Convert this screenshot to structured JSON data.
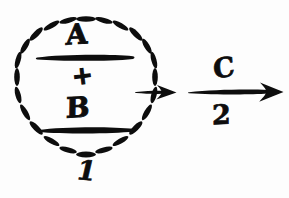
{
  "figure": {
    "background_color": "#fdfdfd",
    "ink_color": "#0d0d0d"
  },
  "group": {
    "name": "dashed-circle-group",
    "shape": "dashed-circle",
    "label_below": "1",
    "expression": {
      "upper_fraction": {
        "numerator": "A",
        "bar": "fraction-bar"
      },
      "operator": "+",
      "lower_fraction": {
        "numerator": "B",
        "bar": "fraction-bar"
      }
    }
  },
  "arrows": {
    "short_arrow": {
      "name": "short-exit-arrow",
      "label": ""
    },
    "long_arrow": {
      "name": "long-reaction-arrow",
      "label_above": "C",
      "label_below": "2"
    }
  },
  "icons": {
    "dashed-circle-icon": "dashed-circle",
    "arrow-right-icon": "arrow-right",
    "fraction-bar-icon": "horizontal-rule"
  }
}
